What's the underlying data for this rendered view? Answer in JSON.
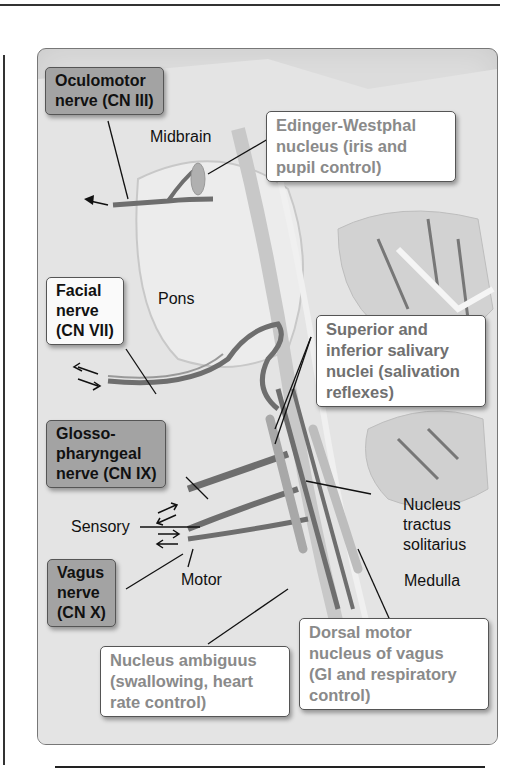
{
  "figure": {
    "region_labels": {
      "midbrain": "Midbrain",
      "pons": "Pons",
      "medulla": "Medulla",
      "sensory": "Sensory",
      "motor": "Motor",
      "nucleus_tractus_solitarius": "Nucleus\ntractus\nsolitarius"
    },
    "nerves": [
      {
        "id": "cn3",
        "label": "Oculomotor\nnerve (CN III)",
        "style": "dark"
      },
      {
        "id": "cn7",
        "label": "Facial\nnerve\n(CN VII)",
        "style": "light"
      },
      {
        "id": "cn9",
        "label": "Glosso-\npharyngeal\nnerve (CN IX)",
        "style": "dark"
      },
      {
        "id": "cn10",
        "label": "Vagus\nnerve\n(CN X)",
        "style": "dark"
      }
    ],
    "nuclei": [
      {
        "id": "edinger_westphal",
        "label": "Edinger-Westphal\nnucleus (iris and\npupil control)"
      },
      {
        "id": "salivary",
        "label": "Superior and\ninferior salivary\nnuclei (salivation\nreflexes)"
      },
      {
        "id": "ambiguus",
        "label": "Nucleus ambiguus\n(swallowing, heart\nrate control)"
      },
      {
        "id": "dorsal_motor",
        "label": "Dorsal motor\nnucleus of vagus\n(GI and respiratory\ncontrol)"
      }
    ],
    "colors": {
      "background": "#dcdcdc",
      "nerve_fiber": "#6e6e6e",
      "dark_box": "#a3a3a3",
      "info_text": "#8a8a8a"
    }
  }
}
